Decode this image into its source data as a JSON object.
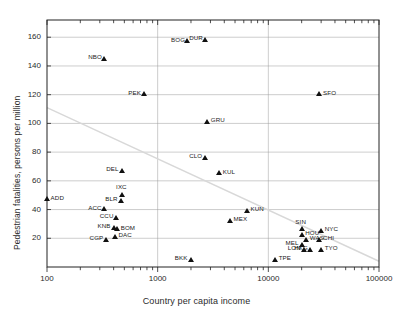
{
  "chart_data": {
    "type": "scatter",
    "title": "",
    "xlabel": "Country per capita income",
    "ylabel": "Pedestrian fatalities, persons per million",
    "xscale": "log",
    "yscale": "linear",
    "xlim": [
      100,
      100000
    ],
    "ylim": [
      0,
      172
    ],
    "xticks": [
      100,
      1000,
      10000,
      100000
    ],
    "xticklabels": [
      "100",
      "1000",
      "10000",
      "100000"
    ],
    "yticks": [
      20,
      40,
      60,
      80,
      100,
      120,
      140,
      160
    ],
    "yticklabels": [
      "20",
      "40",
      "60",
      "80",
      "100",
      "120",
      "140",
      "160"
    ],
    "grid": true,
    "legend": "none",
    "marker": "triangle",
    "marker_color": "#111111",
    "trendline": {
      "visible": true,
      "color": "#d8d8d8",
      "x_start": 100,
      "y_start": 111,
      "x_end": 100000,
      "y_end": 4
    },
    "points": [
      {
        "label": "ADD",
        "x": 100,
        "y": 47,
        "label_side": "right"
      },
      {
        "label": "NBO",
        "x": 330,
        "y": 145,
        "label_side": "left"
      },
      {
        "label": "PEK",
        "x": 760,
        "y": 120,
        "label_side": "left"
      },
      {
        "label": "BOG",
        "x": 1850,
        "y": 157,
        "label_side": "left"
      },
      {
        "label": "DUR",
        "x": 2700,
        "y": 158,
        "label_side": "left"
      },
      {
        "label": "SFO",
        "x": 29000,
        "y": 120,
        "label_side": "right"
      },
      {
        "label": "GRU",
        "x": 2800,
        "y": 101,
        "label_side": "right"
      },
      {
        "label": "CLO",
        "x": 2700,
        "y": 76,
        "label_side": "left"
      },
      {
        "label": "KUL",
        "x": 3600,
        "y": 65,
        "label_side": "right"
      },
      {
        "label": "DEL",
        "x": 480,
        "y": 67,
        "label_side": "left"
      },
      {
        "label": "IXC",
        "x": 480,
        "y": 50,
        "label_side": "above"
      },
      {
        "label": "BLR",
        "x": 470,
        "y": 46,
        "label_side": "left"
      },
      {
        "label": "ACC",
        "x": 330,
        "y": 40,
        "label_side": "left"
      },
      {
        "label": "CCU",
        "x": 420,
        "y": 34,
        "label_side": "left"
      },
      {
        "label": "KNB",
        "x": 400,
        "y": 27,
        "label_side": "left"
      },
      {
        "label": "BOM",
        "x": 430,
        "y": 26,
        "label_side": "right"
      },
      {
        "label": "CGP",
        "x": 340,
        "y": 19,
        "label_side": "left"
      },
      {
        "label": "DAC",
        "x": 410,
        "y": 21,
        "label_side": "right"
      },
      {
        "label": "BKK",
        "x": 2000,
        "y": 5,
        "label_side": "left"
      },
      {
        "label": "KUN",
        "x": 6400,
        "y": 39,
        "label_side": "right"
      },
      {
        "label": "MEX",
        "x": 4500,
        "y": 32,
        "label_side": "right"
      },
      {
        "label": "TPE",
        "x": 11500,
        "y": 5,
        "label_side": "right"
      },
      {
        "label": "SIN",
        "x": 20000,
        "y": 26,
        "label_side": "above"
      },
      {
        "label": "HOU",
        "x": 20000,
        "y": 22,
        "label_side": "right"
      },
      {
        "label": "NYC",
        "x": 30000,
        "y": 25,
        "label_side": "right"
      },
      {
        "label": "WAS",
        "x": 22000,
        "y": 19,
        "label_side": "right"
      },
      {
        "label": "CHI",
        "x": 29000,
        "y": 19,
        "label_side": "right"
      },
      {
        "label": "MEL",
        "x": 20000,
        "y": 15,
        "label_side": "left"
      },
      {
        "label": "LON",
        "x": 21000,
        "y": 12,
        "label_side": "left"
      },
      {
        "label": "HKG",
        "x": 24000,
        "y": 12,
        "label_side": "left"
      },
      {
        "label": "TYO",
        "x": 30000,
        "y": 12,
        "label_side": "right"
      }
    ]
  }
}
